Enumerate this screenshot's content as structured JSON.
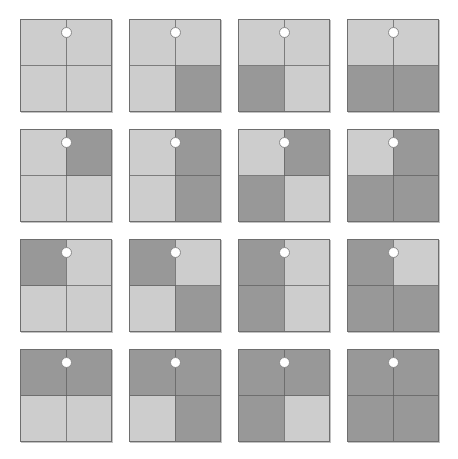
{
  "figure": {
    "rows": 4,
    "columns": 4,
    "total_cards": 16
  },
  "colors": {
    "background": "#ffffff",
    "light_quadrant": "#cdcdcd",
    "dark_quadrant": "#989898",
    "card_border": "#6e6e6e",
    "divider_line": "#606060",
    "fixation_dot_fill": "#ffffff",
    "fixation_dot_stroke": "#8a8a8a"
  },
  "legend": {
    "quadrant_order": [
      "top-left",
      "top-right",
      "bottom-left",
      "bottom-right"
    ],
    "shade_values": [
      "light",
      "dark"
    ]
  },
  "cards": [
    {
      "id": "card-1",
      "row": 1,
      "column": 1,
      "dark_count": 0,
      "quadrants": {
        "top_left": "light",
        "top_right": "light",
        "bottom_left": "light",
        "bottom_right": "light"
      },
      "fixation_dot": "white-dot"
    },
    {
      "id": "card-2",
      "row": 1,
      "column": 2,
      "dark_count": 1,
      "quadrants": {
        "top_left": "light",
        "top_right": "light",
        "bottom_left": "light",
        "bottom_right": "dark"
      },
      "fixation_dot": "white-dot"
    },
    {
      "id": "card-3",
      "row": 1,
      "column": 3,
      "dark_count": 1,
      "quadrants": {
        "top_left": "light",
        "top_right": "light",
        "bottom_left": "dark",
        "bottom_right": "light"
      },
      "fixation_dot": "white-dot"
    },
    {
      "id": "card-4",
      "row": 1,
      "column": 4,
      "dark_count": 2,
      "quadrants": {
        "top_left": "light",
        "top_right": "light",
        "bottom_left": "dark",
        "bottom_right": "dark"
      },
      "fixation_dot": "white-dot"
    },
    {
      "id": "card-5",
      "row": 2,
      "column": 1,
      "dark_count": 1,
      "quadrants": {
        "top_left": "light",
        "top_right": "dark",
        "bottom_left": "light",
        "bottom_right": "light"
      },
      "fixation_dot": "white-dot"
    },
    {
      "id": "card-6",
      "row": 2,
      "column": 2,
      "dark_count": 2,
      "quadrants": {
        "top_left": "light",
        "top_right": "dark",
        "bottom_left": "light",
        "bottom_right": "dark"
      },
      "fixation_dot": "white-dot"
    },
    {
      "id": "card-7",
      "row": 2,
      "column": 3,
      "dark_count": 2,
      "quadrants": {
        "top_left": "light",
        "top_right": "dark",
        "bottom_left": "dark",
        "bottom_right": "light"
      },
      "fixation_dot": "white-dot"
    },
    {
      "id": "card-8",
      "row": 2,
      "column": 4,
      "dark_count": 3,
      "quadrants": {
        "top_left": "light",
        "top_right": "dark",
        "bottom_left": "dark",
        "bottom_right": "dark"
      },
      "fixation_dot": "white-dot"
    },
    {
      "id": "card-9",
      "row": 3,
      "column": 1,
      "dark_count": 1,
      "quadrants": {
        "top_left": "dark",
        "top_right": "light",
        "bottom_left": "light",
        "bottom_right": "light"
      },
      "fixation_dot": "white-dot"
    },
    {
      "id": "card-10",
      "row": 3,
      "column": 2,
      "dark_count": 2,
      "quadrants": {
        "top_left": "dark",
        "top_right": "light",
        "bottom_left": "light",
        "bottom_right": "dark"
      },
      "fixation_dot": "white-dot"
    },
    {
      "id": "card-11",
      "row": 3,
      "column": 3,
      "dark_count": 2,
      "quadrants": {
        "top_left": "dark",
        "top_right": "light",
        "bottom_left": "dark",
        "bottom_right": "light"
      },
      "fixation_dot": "white-dot"
    },
    {
      "id": "card-12",
      "row": 3,
      "column": 4,
      "dark_count": 3,
      "quadrants": {
        "top_left": "dark",
        "top_right": "light",
        "bottom_left": "dark",
        "bottom_right": "dark"
      },
      "fixation_dot": "white-dot"
    },
    {
      "id": "card-13",
      "row": 4,
      "column": 1,
      "dark_count": 2,
      "quadrants": {
        "top_left": "dark",
        "top_right": "dark",
        "bottom_left": "light",
        "bottom_right": "light"
      },
      "fixation_dot": "white-dot"
    },
    {
      "id": "card-14",
      "row": 4,
      "column": 2,
      "dark_count": 3,
      "quadrants": {
        "top_left": "dark",
        "top_right": "dark",
        "bottom_left": "light",
        "bottom_right": "dark"
      },
      "fixation_dot": "white-dot"
    },
    {
      "id": "card-15",
      "row": 4,
      "column": 3,
      "dark_count": 3,
      "quadrants": {
        "top_left": "dark",
        "top_right": "dark",
        "bottom_left": "dark",
        "bottom_right": "light"
      },
      "fixation_dot": "white-dot"
    },
    {
      "id": "card-16",
      "row": 4,
      "column": 4,
      "dark_count": 4,
      "quadrants": {
        "top_left": "dark",
        "top_right": "dark",
        "bottom_left": "dark",
        "bottom_right": "dark"
      },
      "fixation_dot": "white-dot"
    }
  ]
}
